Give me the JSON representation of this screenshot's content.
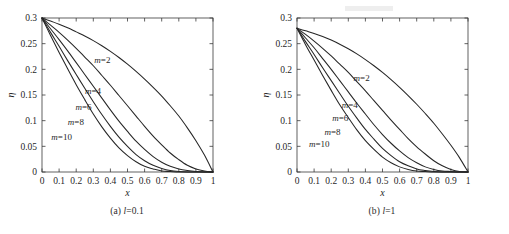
{
  "figure": {
    "panels": [
      {
        "id": "a",
        "caption_prefix": "(a)",
        "caption_symbol": "l",
        "caption_value": "=0.1"
      },
      {
        "id": "b",
        "caption_prefix": "(b)",
        "caption_symbol": "l",
        "caption_value": "=1"
      }
    ]
  },
  "chart_data": [
    {
      "type": "line",
      "panel": "a",
      "title": "(a) l=0.1",
      "xlabel": "x",
      "ylabel": "η",
      "xlim": [
        0,
        1
      ],
      "ylim": [
        0,
        0.3
      ],
      "xticks": [
        0,
        0.1,
        0.2,
        0.3,
        0.4,
        0.5,
        0.6,
        0.7,
        0.8,
        0.9,
        1
      ],
      "xticklabels": [
        "0",
        "0.1",
        "0.2",
        "0.3",
        "0.4",
        "0.5",
        "0.6",
        "0.7",
        "0.8",
        "0.9",
        "1"
      ],
      "yticks": [
        0,
        0.05,
        0.1,
        0.15,
        0.2,
        0.25,
        0.3
      ],
      "yticklabels": [
        "0",
        "0.05",
        "0.1",
        "0.15",
        "0.2",
        "0.25",
        "0.3"
      ],
      "grid": false,
      "legend": "inline-annotations",
      "y0": 0.3,
      "series": [
        {
          "name": "m=2",
          "label": "m=2",
          "label_x": 0.4,
          "label_y": 0.213,
          "x": [
            0,
            0.05,
            0.1,
            0.15,
            0.2,
            0.25,
            0.3,
            0.35,
            0.4,
            0.45,
            0.5,
            0.55,
            0.6,
            0.65,
            0.7,
            0.75,
            0.8,
            0.85,
            0.9,
            0.95,
            1
          ],
          "values": [
            0.3,
            0.294,
            0.288,
            0.281,
            0.273,
            0.265,
            0.256,
            0.246,
            0.235,
            0.223,
            0.21,
            0.196,
            0.181,
            0.165,
            0.148,
            0.129,
            0.109,
            0.086,
            0.061,
            0.033,
            0.0
          ]
        },
        {
          "name": "m=4",
          "label": "m=4",
          "label_x": 0.345,
          "label_y": 0.152,
          "x": [
            0,
            0.05,
            0.1,
            0.15,
            0.2,
            0.25,
            0.3,
            0.35,
            0.4,
            0.45,
            0.5,
            0.55,
            0.6,
            0.65,
            0.7,
            0.75,
            0.8,
            0.85,
            0.9,
            0.95,
            1
          ],
          "values": [
            0.3,
            0.286,
            0.272,
            0.257,
            0.241,
            0.224,
            0.207,
            0.188,
            0.169,
            0.149,
            0.129,
            0.109,
            0.089,
            0.07,
            0.053,
            0.037,
            0.024,
            0.013,
            0.006,
            0.002,
            0.0
          ]
        },
        {
          "name": "m=6",
          "label": "m=6",
          "label_x": 0.29,
          "label_y": 0.12,
          "x": [
            0,
            0.05,
            0.1,
            0.15,
            0.2,
            0.25,
            0.3,
            0.35,
            0.4,
            0.45,
            0.5,
            0.55,
            0.6,
            0.65,
            0.7,
            0.75,
            0.8,
            0.85,
            0.9,
            0.95,
            1
          ],
          "values": [
            0.3,
            0.279,
            0.258,
            0.236,
            0.213,
            0.19,
            0.167,
            0.144,
            0.121,
            0.099,
            0.079,
            0.06,
            0.044,
            0.03,
            0.019,
            0.011,
            0.006,
            0.003,
            0.001,
            0.0,
            0.0
          ]
        },
        {
          "name": "m=8",
          "label": "m=8",
          "label_x": 0.245,
          "label_y": 0.092,
          "x": [
            0,
            0.05,
            0.1,
            0.15,
            0.2,
            0.25,
            0.3,
            0.35,
            0.4,
            0.45,
            0.5,
            0.55,
            0.6,
            0.65,
            0.7,
            0.75,
            0.8,
            0.85,
            0.9,
            0.95,
            1
          ],
          "values": [
            0.3,
            0.272,
            0.245,
            0.217,
            0.19,
            0.163,
            0.137,
            0.112,
            0.089,
            0.068,
            0.05,
            0.034,
            0.022,
            0.013,
            0.007,
            0.003,
            0.001,
            0.0,
            0.0,
            0.0,
            0.0
          ]
        },
        {
          "name": "m=10",
          "label": "m=10",
          "label_x": 0.175,
          "label_y": 0.063,
          "x": [
            0,
            0.05,
            0.1,
            0.15,
            0.2,
            0.25,
            0.3,
            0.35,
            0.4,
            0.45,
            0.5,
            0.55,
            0.6,
            0.65,
            0.7,
            0.75,
            0.8,
            0.85,
            0.9,
            0.95,
            1
          ],
          "values": [
            0.3,
            0.266,
            0.233,
            0.201,
            0.17,
            0.141,
            0.113,
            0.088,
            0.066,
            0.047,
            0.032,
            0.02,
            0.011,
            0.006,
            0.002,
            0.001,
            0.0,
            0.0,
            0.0,
            0.0,
            0.0
          ]
        }
      ]
    },
    {
      "type": "line",
      "panel": "b",
      "title": "(b) l=1",
      "xlabel": "x",
      "ylabel": "η",
      "xlim": [
        0,
        1
      ],
      "ylim": [
        0,
        0.3
      ],
      "xticks": [
        0,
        0.1,
        0.2,
        0.3,
        0.4,
        0.5,
        0.6,
        0.7,
        0.8,
        0.9,
        1
      ],
      "xticklabels": [
        "0",
        "0.1",
        "0.2",
        "0.3",
        "0.4",
        "0.5",
        "0.6",
        "0.7",
        "0.8",
        "0.9",
        "1"
      ],
      "yticks": [
        0,
        0.05,
        0.1,
        0.15,
        0.2,
        0.25,
        0.3
      ],
      "yticklabels": [
        "0",
        "0.05",
        "0.1",
        "0.15",
        "0.2",
        "0.25",
        "0.3"
      ],
      "grid": false,
      "legend": "inline-annotations",
      "y0": 0.28,
      "series": [
        {
          "name": "m=2",
          "label": "m=2",
          "label_x": 0.425,
          "label_y": 0.178,
          "x": [
            0,
            0.05,
            0.1,
            0.15,
            0.2,
            0.25,
            0.3,
            0.35,
            0.4,
            0.45,
            0.5,
            0.55,
            0.6,
            0.65,
            0.7,
            0.75,
            0.8,
            0.85,
            0.9,
            0.95,
            1
          ],
          "values": [
            0.28,
            0.275,
            0.27,
            0.264,
            0.257,
            0.249,
            0.24,
            0.23,
            0.219,
            0.207,
            0.194,
            0.18,
            0.165,
            0.149,
            0.132,
            0.114,
            0.095,
            0.074,
            0.052,
            0.028,
            0.0
          ]
        },
        {
          "name": "m=4",
          "label": "m=4",
          "label_x": 0.355,
          "label_y": 0.125,
          "x": [
            0,
            0.05,
            0.1,
            0.15,
            0.2,
            0.25,
            0.3,
            0.35,
            0.4,
            0.45,
            0.5,
            0.55,
            0.6,
            0.65,
            0.7,
            0.75,
            0.8,
            0.85,
            0.9,
            0.95,
            1
          ],
          "values": [
            0.28,
            0.268,
            0.255,
            0.241,
            0.226,
            0.21,
            0.194,
            0.176,
            0.158,
            0.139,
            0.12,
            0.101,
            0.083,
            0.065,
            0.049,
            0.035,
            0.022,
            0.012,
            0.005,
            0.001,
            0.0
          ]
        },
        {
          "name": "m=6",
          "label": "m=6",
          "label_x": 0.3,
          "label_y": 0.1,
          "x": [
            0,
            0.05,
            0.1,
            0.15,
            0.2,
            0.25,
            0.3,
            0.35,
            0.4,
            0.45,
            0.5,
            0.55,
            0.6,
            0.65,
            0.7,
            0.75,
            0.8,
            0.85,
            0.9,
            0.95,
            1
          ],
          "values": [
            0.28,
            0.261,
            0.242,
            0.221,
            0.2,
            0.178,
            0.156,
            0.134,
            0.113,
            0.092,
            0.073,
            0.056,
            0.041,
            0.028,
            0.018,
            0.01,
            0.005,
            0.002,
            0.001,
            0.0,
            0.0
          ]
        },
        {
          "name": "m=8",
          "label": "m=8",
          "label_x": 0.255,
          "label_y": 0.073,
          "x": [
            0,
            0.05,
            0.1,
            0.15,
            0.2,
            0.25,
            0.3,
            0.35,
            0.4,
            0.45,
            0.5,
            0.55,
            0.6,
            0.65,
            0.7,
            0.75,
            0.8,
            0.85,
            0.9,
            0.95,
            1
          ],
          "values": [
            0.28,
            0.254,
            0.229,
            0.203,
            0.178,
            0.153,
            0.128,
            0.105,
            0.083,
            0.064,
            0.046,
            0.032,
            0.02,
            0.012,
            0.006,
            0.003,
            0.001,
            0.0,
            0.0,
            0.0,
            0.0
          ]
        },
        {
          "name": "m=10",
          "label": "m=10",
          "label_x": 0.19,
          "label_y": 0.048,
          "x": [
            0,
            0.05,
            0.1,
            0.15,
            0.2,
            0.25,
            0.3,
            0.35,
            0.4,
            0.45,
            0.5,
            0.55,
            0.6,
            0.65,
            0.7,
            0.75,
            0.8,
            0.85,
            0.9,
            0.95,
            1
          ],
          "values": [
            0.28,
            0.248,
            0.218,
            0.188,
            0.159,
            0.131,
            0.106,
            0.082,
            0.061,
            0.044,
            0.029,
            0.018,
            0.01,
            0.005,
            0.002,
            0.001,
            0.0,
            0.0,
            0.0,
            0.0,
            0.0
          ]
        }
      ]
    }
  ]
}
